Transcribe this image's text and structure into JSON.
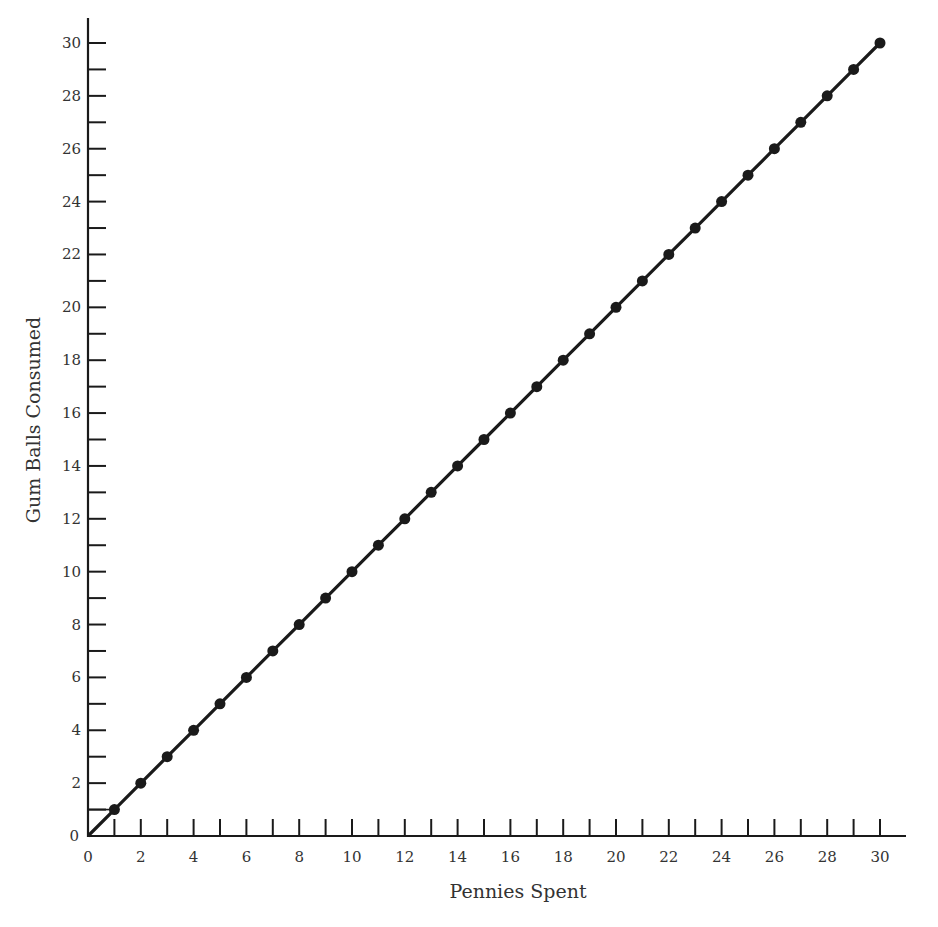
{
  "chart_data": {
    "type": "line",
    "title": "",
    "xlabel": "Pennies Spent",
    "ylabel": "Gum Balls Consumed",
    "xlim": [
      0,
      30
    ],
    "ylim": [
      0,
      30
    ],
    "x_tick_labels": [
      "0",
      "2",
      "4",
      "6",
      "8",
      "10",
      "12",
      "14",
      "16",
      "18",
      "20",
      "22",
      "24",
      "26",
      "28",
      "30"
    ],
    "y_tick_labels": [
      "0",
      "2",
      "4",
      "6",
      "8",
      "10",
      "12",
      "14",
      "16",
      "18",
      "20",
      "22",
      "24",
      "26",
      "28",
      "30"
    ],
    "minor_ticks_every": 1,
    "grid": false,
    "legend": null,
    "markers": true,
    "annotation": "guide lines from axes to point (1,1)",
    "series": [
      {
        "name": "Gum Balls Consumed",
        "x": [
          0,
          1,
          2,
          3,
          4,
          5,
          6,
          7,
          8,
          9,
          10,
          11,
          12,
          13,
          14,
          15,
          16,
          17,
          18,
          19,
          20,
          21,
          22,
          23,
          24,
          25,
          26,
          27,
          28,
          29,
          30
        ],
        "y": [
          0,
          1,
          2,
          3,
          4,
          5,
          6,
          7,
          8,
          9,
          10,
          11,
          12,
          13,
          14,
          15,
          16,
          17,
          18,
          19,
          20,
          21,
          22,
          23,
          24,
          25,
          26,
          27,
          28,
          29,
          30
        ]
      }
    ]
  }
}
